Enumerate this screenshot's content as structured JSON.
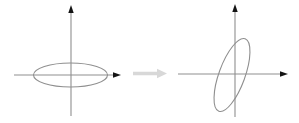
{
  "canvas": {
    "width": 299,
    "height": 123,
    "background": "#ffffff"
  },
  "colors": {
    "axis": "#8f8f8f",
    "arrowhead": "#141414",
    "ellipse": "#8f8f8f",
    "transform_arrow": "#d8d8d8"
  },
  "stroke_width": 1.1,
  "axis_arrowhead": {
    "length": 8,
    "half_width": 2.7
  },
  "left_system": {
    "origin": {
      "x": 71,
      "y": 75
    },
    "x_axis": {
      "line_from": 14,
      "line_to": 114,
      "tip": 121
    },
    "y_axis": {
      "line_from": 116,
      "line_to": 12,
      "tip": 5
    },
    "ellipse": {
      "cx": 70.5,
      "cy": 75,
      "rx": 37,
      "ry": 12,
      "rotation": 0
    }
  },
  "right_system": {
    "origin": {
      "x": 235,
      "y": 74
    },
    "x_axis": {
      "line_from": 178,
      "line_to": 281,
      "tip": 288
    },
    "y_axis": {
      "line_from": 117,
      "line_to": 11,
      "tip": 4
    },
    "ellipse": {
      "cx": 232,
      "cy": 75,
      "rx": 13,
      "ry": 38.5,
      "rotation": 20
    }
  },
  "transform_arrow": {
    "y": 73.5,
    "x_from": 133,
    "body_to": 157,
    "tip": 167,
    "thickness": 3.4,
    "head_height": 9.6
  }
}
